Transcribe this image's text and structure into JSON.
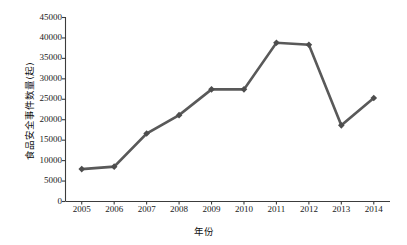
{
  "chart_data": {
    "type": "line",
    "title": "",
    "xlabel": "年份",
    "ylabel": "食品安全事件数量(起)",
    "categories": [
      "2005",
      "2006",
      "2007",
      "2008",
      "2009",
      "2010",
      "2011",
      "2012",
      "2013",
      "2014"
    ],
    "values": [
      7800,
      8400,
      16500,
      21000,
      27300,
      27300,
      38700,
      38200,
      18500,
      25200
    ],
    "series": [
      {
        "name": "食品安全事件数量(起)",
        "values": [
          7800,
          8400,
          16500,
          21000,
          27300,
          27300,
          38700,
          38200,
          18500,
          25200
        ]
      }
    ],
    "ylim": [
      0,
      45000
    ],
    "yticks": [
      0,
      5000,
      10000,
      15000,
      20000,
      25000,
      30000,
      35000,
      40000,
      45000
    ],
    "ytick_labels": [
      "0",
      "5000",
      "10000",
      "15000",
      "20000",
      "25000",
      "30000",
      "35000",
      "40000",
      "45000"
    ],
    "xtick_labels": [
      "2005",
      "2006",
      "2007",
      "2008",
      "2009",
      "2010",
      "2011",
      "2012",
      "2013",
      "2014"
    ],
    "grid": false,
    "legend": false,
    "legend_position": "none",
    "marker": "diamond",
    "line_color": "#595959",
    "marker_color": "#4d4d4d",
    "axis_color": "#3c3c3c",
    "background_color": "#ffffff"
  }
}
